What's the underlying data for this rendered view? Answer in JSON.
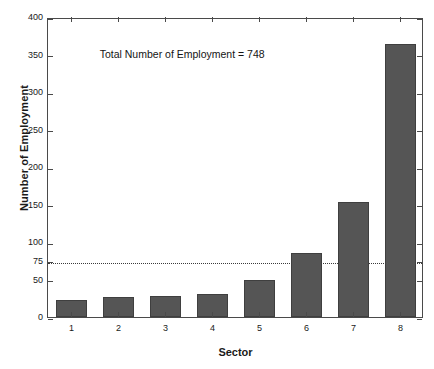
{
  "chart_data": {
    "type": "bar",
    "title": "",
    "xlabel": "Sector",
    "ylabel": "Number of Employment",
    "categories": [
      "1",
      "2",
      "3",
      "4",
      "5",
      "6",
      "7",
      "8"
    ],
    "values": [
      23,
      27,
      28,
      31,
      49,
      85,
      153,
      364
    ],
    "ylim": [
      0,
      400
    ],
    "yticks": [
      0,
      50,
      75,
      100,
      150,
      200,
      250,
      300,
      350,
      400
    ],
    "ytick_labels": [
      "0",
      "50",
      "75",
      "100",
      "150",
      "200",
      "250",
      "300",
      "350",
      "400"
    ],
    "grid": false,
    "legend": null,
    "annotations": [
      {
        "text": "Total Number of Employment = 748",
        "x": 1.6,
        "y": 352
      }
    ],
    "reference_line": {
      "value": 75,
      "style": "dotted",
      "orientation": "horizontal"
    },
    "bar_color": "#555555",
    "bar_edge_color": "#3f3f3f",
    "axis_color": "#4a4a4a",
    "background": "#ffffff"
  }
}
